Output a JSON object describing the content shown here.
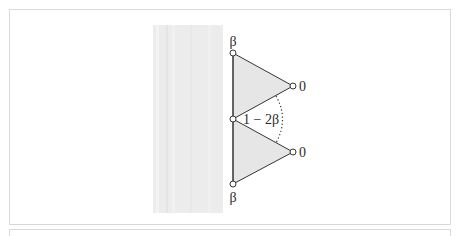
{
  "figure": {
    "labels": {
      "top_node": "β",
      "bottom_node": "β",
      "upper_right_node": "0",
      "lower_right_node": "0",
      "angle": "1 − 2β"
    },
    "colors": {
      "triangle_fill": "#e6e6e6",
      "background_strip": "#ececec",
      "stroke": "#333333",
      "panel_border": "#d9d9d9"
    }
  }
}
